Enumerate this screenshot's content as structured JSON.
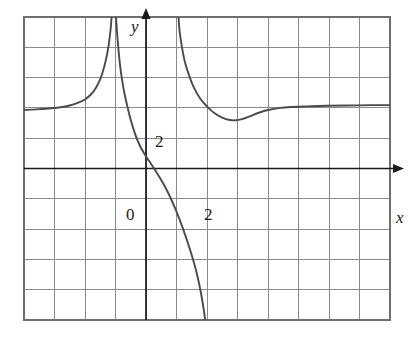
{
  "figure": {
    "kind": "cartesian-graph",
    "background_color": "#ffffff",
    "grid_color": "#8a8a8a",
    "frame_color": "#6f6f6f",
    "axis_color": "#1a1a1a",
    "curve_color": "#4a4a4a"
  },
  "axes": {
    "y_axis_label": "y",
    "x_axis_label": "x",
    "origin_label": "0",
    "y_tick_label": "2",
    "x_tick_label": "2",
    "x_range": [
      -4,
      8
    ],
    "y_range": [
      -5,
      5
    ],
    "grid_columns": 12,
    "grid_rows": 10,
    "grid_step": 1,
    "grid_visible": true
  },
  "chart_data": {
    "type": "line",
    "title": "",
    "xlabel": "x",
    "ylabel": "y",
    "xlim": [
      -4,
      8
    ],
    "ylim": [
      -5,
      5
    ],
    "grid": true,
    "legend": "none",
    "xticks": [
      2
    ],
    "yticks": [
      2
    ],
    "annotations": [
      {
        "text": "0",
        "x": -0.45,
        "y": -0.35
      },
      {
        "text": "2",
        "x": 0.25,
        "y": 2.0
      },
      {
        "text": "2",
        "x": 2.0,
        "y": -0.35
      },
      {
        "text": "y",
        "x": -0.6,
        "y": 4.75
      },
      {
        "text": "x",
        "x": 8.15,
        "y": -0.25
      }
    ],
    "asymptotes": {
      "vertical": [
        -1.05,
        1.0
      ],
      "horizontal": [
        2.0
      ]
    },
    "series": [
      {
        "name": "left-branch",
        "comment": "enters from left along y=2, rises to +infinity at x=-1.05",
        "points": [
          [
            -4.0,
            1.93
          ],
          [
            -3.6,
            1.95
          ],
          [
            -3.2,
            1.98
          ],
          [
            -2.8,
            2.02
          ],
          [
            -2.5,
            2.08
          ],
          [
            -2.2,
            2.18
          ],
          [
            -2.0,
            2.28
          ],
          [
            -1.8,
            2.45
          ],
          [
            -1.65,
            2.65
          ],
          [
            -1.5,
            2.95
          ],
          [
            -1.4,
            3.25
          ],
          [
            -1.3,
            3.65
          ],
          [
            -1.22,
            4.1
          ],
          [
            -1.16,
            4.6
          ],
          [
            -1.12,
            5.1
          ]
        ]
      },
      {
        "name": "middle-branch",
        "comment": "falls from +infinity at x=-1.05, crosses y-axis near 0.4, exits bottom near x=1.9",
        "points": [
          [
            -0.99,
            5.1
          ],
          [
            -0.95,
            4.5
          ],
          [
            -0.9,
            3.9
          ],
          [
            -0.85,
            3.4
          ],
          [
            -0.78,
            2.9
          ],
          [
            -0.7,
            2.45
          ],
          [
            -0.6,
            2.0
          ],
          [
            -0.5,
            1.6
          ],
          [
            -0.35,
            1.12
          ],
          [
            -0.2,
            0.75
          ],
          [
            0.0,
            0.4
          ],
          [
            0.2,
            0.1
          ],
          [
            0.45,
            -0.3
          ],
          [
            0.7,
            -0.75
          ],
          [
            0.95,
            -1.3
          ],
          [
            1.2,
            -1.95
          ],
          [
            1.45,
            -2.7
          ],
          [
            1.65,
            -3.4
          ],
          [
            1.8,
            -4.1
          ],
          [
            1.9,
            -4.7
          ],
          [
            1.95,
            -5.1
          ]
        ]
      },
      {
        "name": "right-branch",
        "comment": "falls from +infinity at x=1.0, local minimum near (2.9, 1.6), rises back toward y=2",
        "points": [
          [
            1.06,
            5.1
          ],
          [
            1.1,
            4.55
          ],
          [
            1.18,
            4.0
          ],
          [
            1.28,
            3.5
          ],
          [
            1.42,
            3.05
          ],
          [
            1.58,
            2.65
          ],
          [
            1.78,
            2.3
          ],
          [
            2.0,
            2.05
          ],
          [
            2.25,
            1.82
          ],
          [
            2.5,
            1.68
          ],
          [
            2.75,
            1.6
          ],
          [
            2.95,
            1.59
          ],
          [
            3.15,
            1.63
          ],
          [
            3.4,
            1.72
          ],
          [
            3.7,
            1.84
          ],
          [
            4.0,
            1.93
          ],
          [
            4.4,
            2.0
          ],
          [
            4.8,
            2.03
          ],
          [
            5.3,
            2.05
          ],
          [
            5.9,
            2.07
          ],
          [
            6.6,
            2.08
          ],
          [
            7.4,
            2.09
          ],
          [
            8.0,
            2.09
          ]
        ]
      }
    ]
  }
}
